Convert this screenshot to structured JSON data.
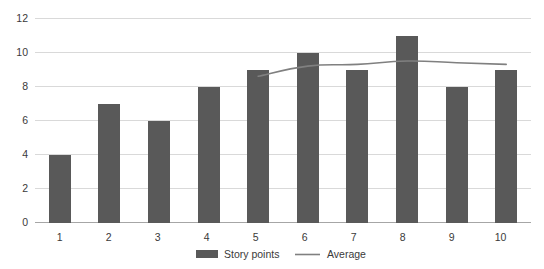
{
  "chart_data": {
    "type": "bar",
    "title": "",
    "subtitle": "",
    "xlabel": "",
    "ylabel": "",
    "categories": [
      "1",
      "2",
      "3",
      "4",
      "5",
      "6",
      "7",
      "8",
      "9",
      "10"
    ],
    "ylim": [
      0,
      12
    ],
    "yticks": [
      "0",
      "2",
      "4",
      "6",
      "8",
      "10",
      "12"
    ],
    "grid": true,
    "legend_position": "bottom",
    "series": [
      {
        "name": "Story points",
        "type": "bar",
        "color": "#595959",
        "values": [
          4,
          7,
          6,
          8,
          9,
          10,
          9,
          11,
          8,
          9
        ]
      },
      {
        "name": "Average",
        "type": "line",
        "color": "#808080",
        "values": [
          null,
          null,
          null,
          null,
          8.6,
          9.2,
          9.3,
          9.5,
          9.4,
          9.3
        ]
      }
    ]
  },
  "legend": {
    "items": [
      {
        "label": "Story points",
        "marker": "bar-swatch",
        "color": "#595959"
      },
      {
        "label": "Average",
        "marker": "line-swatch",
        "color": "#808080"
      }
    ]
  },
  "axis": {
    "y_tick_labels": [
      "12",
      "10",
      "8",
      "6",
      "4",
      "2",
      "0"
    ],
    "x_tick_labels": [
      "1",
      "2",
      "3",
      "4",
      "5",
      "6",
      "7",
      "8",
      "9",
      "10"
    ]
  },
  "colors": {
    "bar": "#595959",
    "line": "#808080",
    "grid": "#d9d9d9",
    "axis": "#a6a6a6",
    "text": "#3a3a3a",
    "background": "#ffffff"
  }
}
